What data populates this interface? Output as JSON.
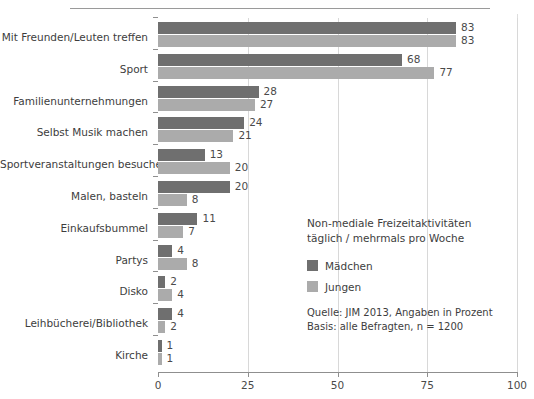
{
  "chart_data": {
    "type": "bar",
    "orientation": "horizontal",
    "title": "",
    "xlabel": "",
    "ylabel": "",
    "xlim": [
      0,
      100
    ],
    "xticks": [
      "0",
      "25",
      "50",
      "75",
      "100"
    ],
    "grid": true,
    "legend_position": "inside-right",
    "categories": [
      "Mit Freunden/Leuten treffen",
      "Sport",
      "Familienunternehmungen",
      "Selbst Musik machen",
      "Sportveranstaltungen besuchen",
      "Malen, basteln",
      "Einkaufsbummel",
      "Partys",
      "Disko",
      "Leihbücherei/Bibliothek",
      "Kirche"
    ],
    "series": [
      {
        "name": "Mädchen",
        "color": "#6f6f6f",
        "values": [
          83,
          68,
          28,
          24,
          13,
          20,
          11,
          4,
          2,
          4,
          1
        ]
      },
      {
        "name": "Jungen",
        "color": "#ababab",
        "values": [
          83,
          77,
          27,
          21,
          20,
          8,
          7,
          8,
          4,
          2,
          1
        ]
      }
    ]
  },
  "legend": {
    "title_line1": "Non-mediale Freizeitaktivitäten",
    "title_line2": "täglich / mehrmals pro Woche",
    "items": [
      {
        "label": "Mädchen",
        "color": "#6f6f6f"
      },
      {
        "label": "Jungen",
        "color": "#ababab"
      }
    ],
    "source_line1": "Quelle: JIM 2013, Angaben in Prozent",
    "source_line2": "Basis: alle Befragten, n = 1200"
  }
}
